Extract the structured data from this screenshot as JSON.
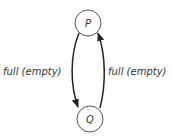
{
  "diagram": {
    "type": "state-transition",
    "nodes": [
      {
        "id": "P",
        "label": "P"
      },
      {
        "id": "Q",
        "label": "Q"
      }
    ],
    "edges": [
      {
        "from": "P",
        "to": "Q",
        "label": "full (empty)",
        "side": "left"
      },
      {
        "from": "Q",
        "to": "P",
        "label": "full (empty)",
        "side": "right"
      }
    ],
    "colors": {
      "stroke": "#333333",
      "node_stroke": "#555555",
      "background": "#ffffff"
    }
  }
}
